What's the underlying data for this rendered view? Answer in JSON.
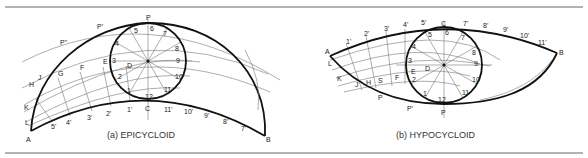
{
  "figure": {
    "colors": {
      "curve": "#111111",
      "construction": "#777777",
      "rule": "#666666",
      "text": "#222222"
    },
    "panels": [
      {
        "id": "a",
        "caption": "(a)  EPICYCLOID",
        "points": {
          "A": "A",
          "B": "B",
          "P": "P",
          "C": "C",
          "D": "D",
          "E": "E",
          "F": "F",
          "G": "G",
          "H": "H",
          "J": "J",
          "K": "K",
          "L": "L",
          "P1": "P'",
          "P2": "P''"
        },
        "circle_divisions": [
          "1",
          "2",
          "3",
          "4",
          "5",
          "6",
          "7",
          "8",
          "9",
          "10",
          "11",
          "12"
        ],
        "base_divisions": [
          "1'",
          "2'",
          "3'",
          "4'",
          "5'",
          "7'",
          "8'",
          "9'",
          "10'",
          "11'"
        ]
      },
      {
        "id": "b",
        "caption": "(b)  HYPOCYCLOID",
        "points": {
          "A": "A",
          "B": "B",
          "C": "C",
          "P": "P",
          "D": "D",
          "E": "E",
          "F": "F",
          "S": "S",
          "H": "H",
          "J": "J",
          "K": "K",
          "L": "L",
          "P1": "P",
          "P2": "P'"
        },
        "circle_divisions": [
          "1",
          "2",
          "3",
          "4",
          "5",
          "6",
          "7",
          "8",
          "9",
          "10",
          "11",
          "12"
        ],
        "base_divisions": [
          "1'",
          "2'",
          "3'",
          "4'",
          "5'",
          "7'",
          "8'",
          "9'",
          "10'",
          "11'"
        ]
      }
    ]
  }
}
